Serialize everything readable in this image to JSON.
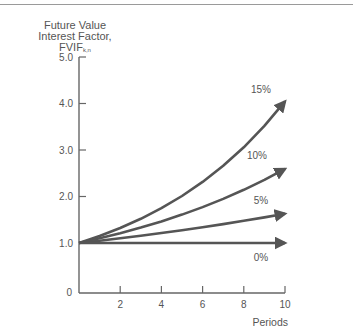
{
  "chart_data": {
    "type": "line",
    "title": "",
    "ylabel_lines": [
      "Future Value",
      "Interest Factor,"
    ],
    "ylabel_symbol": "FVIF",
    "ylabel_subscript": "k,n",
    "xlabel": "Periods",
    "x": [
      0,
      1,
      2,
      3,
      4,
      5,
      6,
      7,
      8,
      9,
      10
    ],
    "xticks": [
      2,
      4,
      6,
      8,
      10
    ],
    "xtick_labels": [
      "2",
      "4",
      "6",
      "8",
      "10"
    ],
    "origin_label": "0",
    "yticks": [
      1.0,
      2.0,
      3.0,
      4.0,
      5.0
    ],
    "ytick_labels": [
      "1.0",
      "2.0",
      "3.0",
      "4.0",
      "5.0"
    ],
    "xlim": [
      0,
      10
    ],
    "ylim": [
      0,
      5.0
    ],
    "grid": false,
    "legend": "inline labels at line ends",
    "series": [
      {
        "name": "15%",
        "values": [
          1.0,
          1.15,
          1.3225,
          1.521,
          1.749,
          2.011,
          2.313,
          2.66,
          3.059,
          3.518,
          4.046
        ]
      },
      {
        "name": "10%",
        "values": [
          1.0,
          1.1,
          1.21,
          1.331,
          1.464,
          1.611,
          1.772,
          1.949,
          2.144,
          2.358,
          2.594
        ]
      },
      {
        "name": "5%",
        "values": [
          1.0,
          1.05,
          1.103,
          1.158,
          1.216,
          1.276,
          1.34,
          1.407,
          1.477,
          1.551,
          1.629
        ]
      },
      {
        "name": "0%",
        "values": [
          1.0,
          1.0,
          1.0,
          1.0,
          1.0,
          1.0,
          1.0,
          1.0,
          1.0,
          1.0,
          1.0
        ]
      }
    ],
    "colors": {
      "line": "#555555",
      "axis": "#666666",
      "text": "#555555"
    }
  }
}
